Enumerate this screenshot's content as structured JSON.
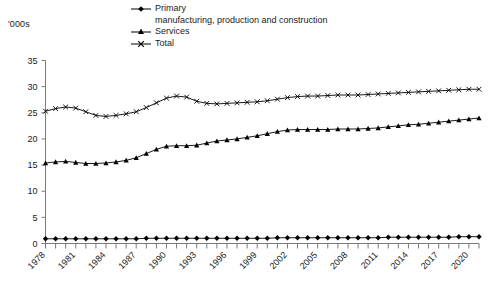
{
  "unit_label": "'000s",
  "legend": {
    "items": [
      {
        "label": "Primary",
        "marker": "diamond-marker-icon"
      },
      {
        "label": "Services",
        "marker": "triangle-marker-icon"
      },
      {
        "label": "Total",
        "marker": "cross-marker-icon"
      }
    ],
    "subtitle": "manufacturing, production and construction"
  },
  "chart_data": {
    "type": "line",
    "title": "",
    "subtitle": "",
    "xlabel": "",
    "ylabel": "'000s",
    "ylim": [
      0,
      35
    ],
    "yticks": [
      0,
      5,
      10,
      15,
      20,
      25,
      30,
      35
    ],
    "grid": false,
    "legend_position": "top",
    "x": [
      1978,
      1979,
      1980,
      1981,
      1982,
      1983,
      1984,
      1985,
      1986,
      1987,
      1988,
      1989,
      1990,
      1991,
      1992,
      1993,
      1994,
      1995,
      1996,
      1997,
      1998,
      1999,
      2000,
      2001,
      2002,
      2003,
      2004,
      2005,
      2006,
      2007,
      2008,
      2009,
      2010,
      2011,
      2012,
      2013,
      2014,
      2015,
      2016,
      2017,
      2018,
      2019,
      2020,
      2021
    ],
    "xtick_labels": [
      "1978",
      "1981",
      "1984",
      "1987",
      "1990",
      "1993",
      "1996",
      "1999",
      "2002",
      "2005",
      "2008",
      "2011",
      "2014",
      "2017",
      "2020"
    ],
    "series": [
      {
        "name": "Primary",
        "marker": "diamond",
        "values": [
          0.9,
          0.9,
          0.9,
          0.9,
          0.9,
          0.9,
          0.9,
          0.9,
          0.9,
          0.9,
          1.0,
          1.0,
          1.0,
          1.0,
          1.0,
          1.0,
          1.0,
          1.0,
          1.0,
          1.0,
          1.0,
          1.0,
          1.0,
          1.1,
          1.1,
          1.1,
          1.1,
          1.1,
          1.1,
          1.1,
          1.1,
          1.1,
          1.1,
          1.1,
          1.2,
          1.2,
          1.2,
          1.2,
          1.2,
          1.2,
          1.2,
          1.3,
          1.3,
          1.3
        ]
      },
      {
        "name": "Services",
        "marker": "triangle",
        "values": [
          15.4,
          15.6,
          15.7,
          15.5,
          15.3,
          15.3,
          15.4,
          15.6,
          15.9,
          16.4,
          17.2,
          18.0,
          18.6,
          18.7,
          18.7,
          18.8,
          19.2,
          19.6,
          19.8,
          20.0,
          20.3,
          20.6,
          21.0,
          21.4,
          21.7,
          21.8,
          21.8,
          21.8,
          21.8,
          21.9,
          21.9,
          21.9,
          22.0,
          22.1,
          22.3,
          22.5,
          22.7,
          22.8,
          23.0,
          23.2,
          23.4,
          23.6,
          23.8,
          24.0
        ]
      },
      {
        "name": "Total",
        "marker": "cross",
        "values": [
          25.3,
          25.8,
          26.1,
          25.9,
          25.2,
          24.5,
          24.3,
          24.5,
          24.8,
          25.2,
          26.0,
          26.9,
          27.8,
          28.2,
          28.0,
          27.2,
          26.8,
          26.7,
          26.8,
          26.9,
          27.0,
          27.1,
          27.3,
          27.6,
          27.9,
          28.1,
          28.2,
          28.2,
          28.3,
          28.4,
          28.4,
          28.4,
          28.5,
          28.6,
          28.7,
          28.8,
          28.9,
          29.0,
          29.1,
          29.2,
          29.3,
          29.4,
          29.5,
          29.5
        ]
      }
    ]
  }
}
